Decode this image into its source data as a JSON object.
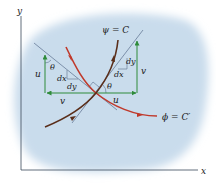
{
  "diagram": {
    "axes": {
      "x_label": "x",
      "y_label": "y"
    },
    "curves": {
      "stream_function": {
        "label": "ψ = C",
        "color": "#5a2e1a"
      },
      "potential_function": {
        "label": "ϕ = C′",
        "color": "#c0392b"
      }
    },
    "left_triangle": {
      "vertical_velocity": "u",
      "horizontal_velocity": "v",
      "angle": "θ",
      "dx": "dx",
      "dy": "dy"
    },
    "right_triangle": {
      "vertical_velocity": "v",
      "horizontal_velocity": "u",
      "angle": "θ",
      "dx": "dx",
      "dy": "dy"
    },
    "colors": {
      "background_blob": "#c9dcec",
      "axis": "#3a4a5a",
      "tangent_line": "#5a6f8c",
      "velocity_arrow": "#2e8b3a",
      "stream_curve": "#5a2e1a",
      "potential_curve": "#c0392b"
    }
  }
}
